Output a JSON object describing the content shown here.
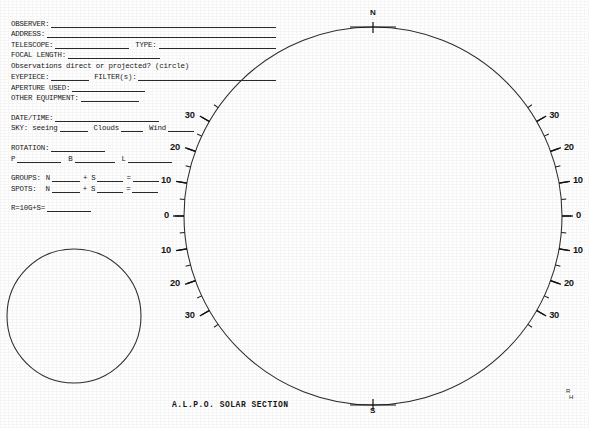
{
  "document": {
    "title": "A.L.P.O. SOLAR SECTION",
    "corner_mark_top": "R",
    "corner_mark_bottom": "H"
  },
  "form": {
    "observer_label": "OBSERVER:",
    "address_label": "ADDRESS:",
    "telescope_label": "TELESCOPE:",
    "type_label": "TYPE:",
    "focal_length_label": "FOCAL LENGTH:",
    "projection_question": "Observations direct or projected? (circle)",
    "eyepiece_label": "EYEPIECE:",
    "filters_label": "FILTER(s):",
    "aperture_label": "APERTURE USED:",
    "other_equipment_label": "OTHER EQUIPMENT:",
    "datetime_label": "DATE/TIME:",
    "sky_label": "SKY: seeing",
    "sky_clouds_label": "Clouds",
    "sky_wind_label": "Wind",
    "rotation_label": "ROTATION:",
    "rotation_p": "P",
    "rotation_b": "B",
    "rotation_l": "L",
    "groups_label": "GROUPS:",
    "spots_label": "SPOTS:",
    "north_abbr": "N",
    "south_abbr": "S",
    "plus_sign": "+",
    "equals_sign": "=",
    "wolf_number_label": "R=10G+S="
  },
  "disk": {
    "pole_north": "N",
    "pole_south": "S",
    "latitude_labels_left": [
      "30",
      "20",
      "10",
      "0",
      "10",
      "20",
      "30"
    ],
    "latitude_labels_right": [
      "30",
      "20",
      "10",
      "0",
      "10",
      "20",
      "30"
    ],
    "latitude_values": [
      30,
      20,
      10,
      0,
      -10,
      -20,
      -30
    ],
    "minor_tick_step_degrees": 5,
    "scale_unit": "degrees heliographic latitude"
  },
  "colors": {
    "ink": "#1a1a1a",
    "line": "#2e2e2e",
    "paper": "#ffffff"
  }
}
